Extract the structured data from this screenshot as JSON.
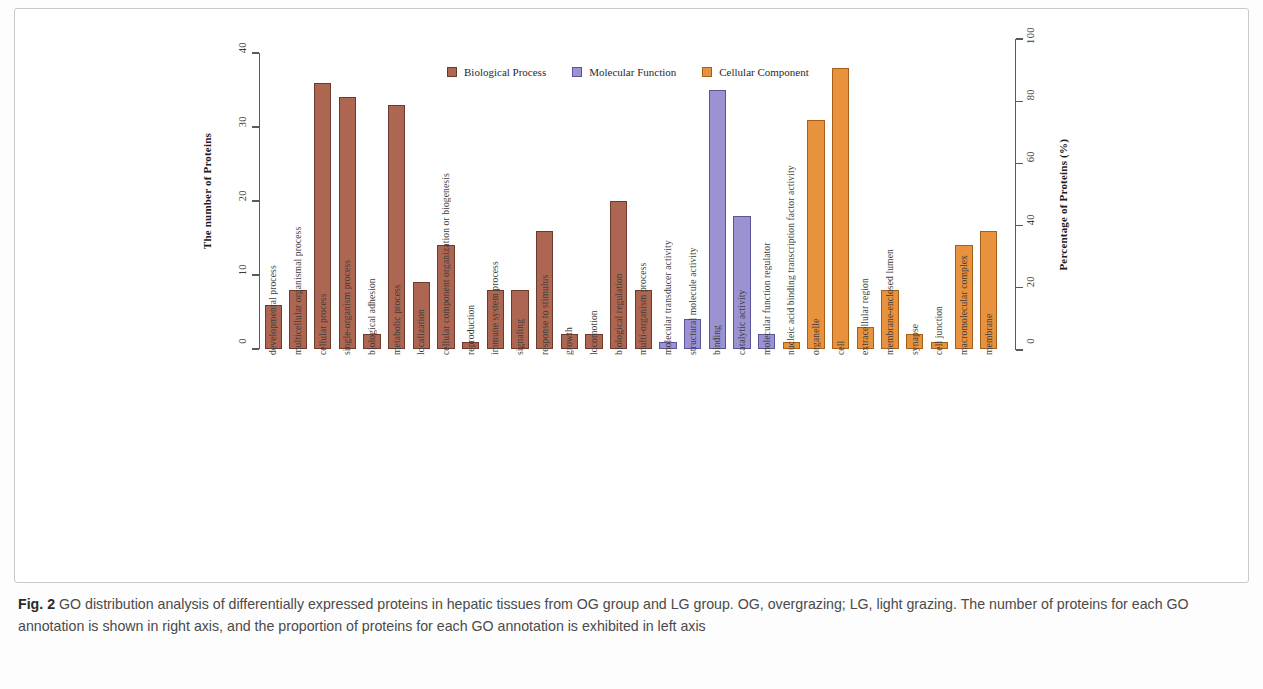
{
  "figure": {
    "label": "Fig. 2",
    "caption": " GO distribution analysis of differentially expressed proteins in hepatic tissues from OG group and LG group. OG, overgrazing; LG, light grazing. The number of proteins for each GO annotation is shown in right axis, and the proportion of proteins for each GO annotation is exhibited in left axis"
  },
  "chart_data": {
    "type": "bar",
    "title": "",
    "xlabel": "",
    "ylabel": "The number of Proteins",
    "y2label": "Percentage of Proteins (%)",
    "ylim": [
      0,
      40
    ],
    "y2lim": [
      0,
      100
    ],
    "yticks": [
      "0",
      "10",
      "20",
      "30",
      "40"
    ],
    "y2ticks": [
      "0",
      "20",
      "40",
      "60",
      "80",
      "100"
    ],
    "grid": false,
    "legend_position": "top-center",
    "legend": [
      {
        "name": "Biological Process",
        "color": "#ad6651",
        "key": "bp"
      },
      {
        "name": "Molecular Function",
        "color": "#9b92d2",
        "key": "mf"
      },
      {
        "name": "Cellular Component",
        "color": "#e9923e",
        "key": "cc"
      }
    ],
    "categories": [
      "developmental process",
      "multicellular organismal process",
      "cellular process",
      "single-organism process",
      "biological adhesion",
      "metabolic process",
      "localization",
      "cellular component organization or biogenesis",
      "reproduction",
      "immune system process",
      "signaling",
      "response to stimulus",
      "growth",
      "locomotion",
      "biological regulation",
      "multi-organism process",
      "molecular transducer activity",
      "structural molecule activity",
      "binding",
      "catalytic activity",
      "molecular function regulator",
      "nucleic acid binding transcription factor activity",
      "organelle",
      "cell",
      "extracellular region",
      "membrane-enclosed lumen",
      "synapse",
      "cell junction",
      "macromolecular complex",
      "membrane"
    ],
    "groups": [
      "bp",
      "bp",
      "bp",
      "bp",
      "bp",
      "bp",
      "bp",
      "bp",
      "bp",
      "bp",
      "bp",
      "bp",
      "bp",
      "bp",
      "bp",
      "bp",
      "mf",
      "mf",
      "mf",
      "mf",
      "mf",
      "cc",
      "cc",
      "cc",
      "cc",
      "cc",
      "cc",
      "cc",
      "cc",
      "cc"
    ],
    "values": [
      6,
      8,
      36,
      34,
      2,
      33,
      9,
      14,
      1,
      8,
      8,
      16,
      2,
      2,
      20,
      8,
      1,
      4,
      35,
      18,
      2,
      1,
      31,
      38,
      3,
      8,
      2,
      1,
      14,
      16
    ]
  }
}
